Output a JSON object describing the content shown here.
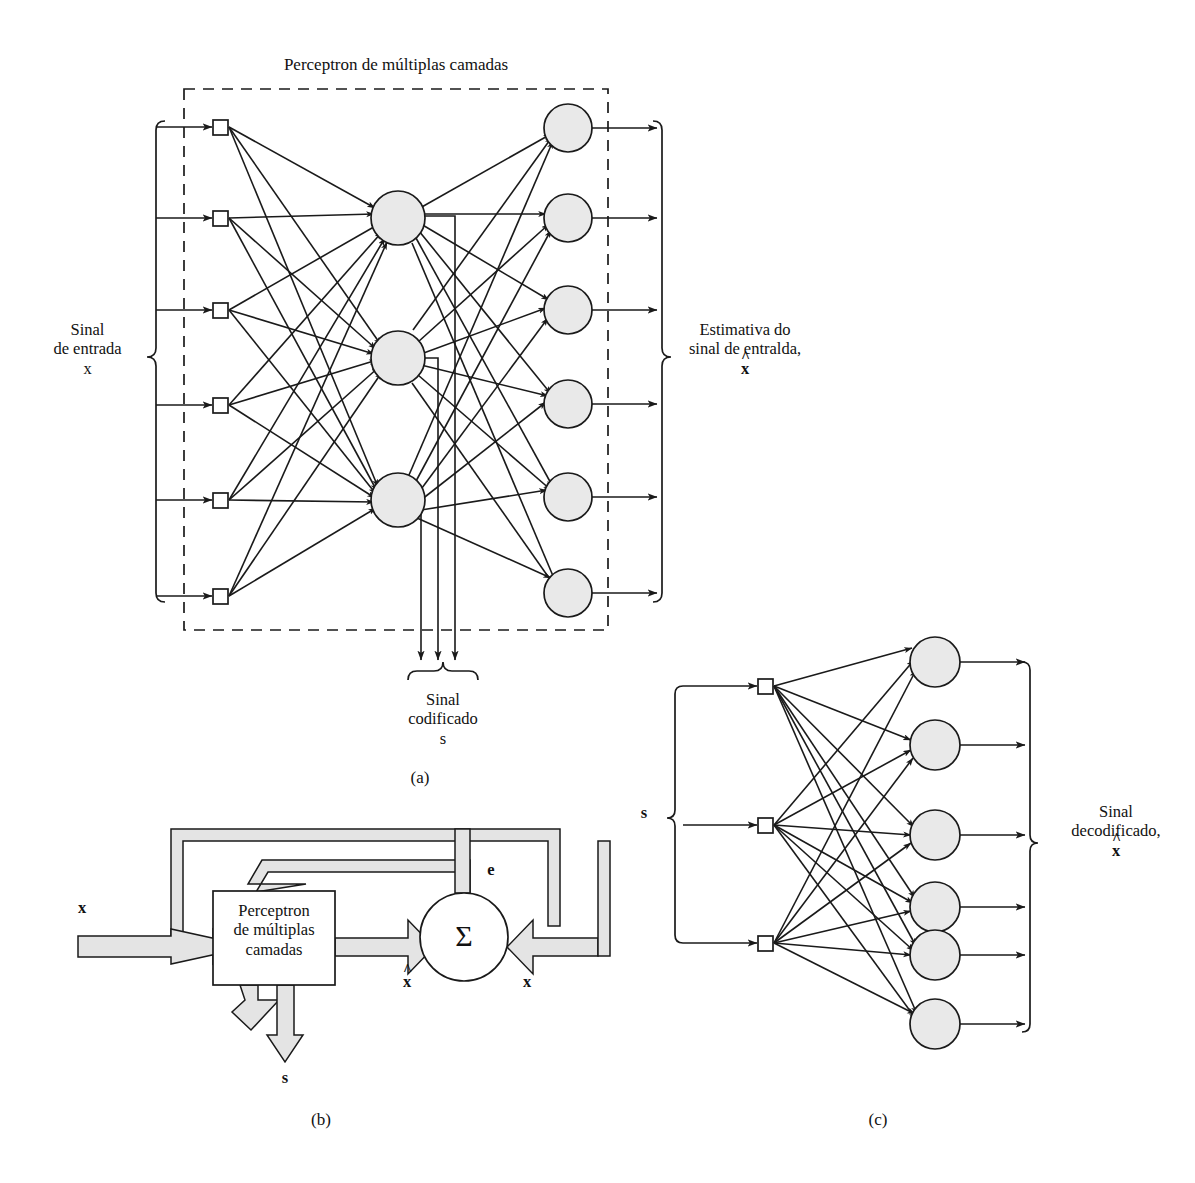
{
  "figure": {
    "type": "diagram",
    "topic": "Multilayer perceptron autoassociative encoder/decoder",
    "language": "pt-BR"
  },
  "panel_a": {
    "caption": "(a)",
    "title": "Perceptron de múltiplas camadas",
    "left_label": {
      "line1": "Sinal",
      "line2": "de entrada",
      "symbol": "x"
    },
    "right_label": {
      "line1": "Estimativa do",
      "line2": "sinal de entralda,",
      "symbol": "x",
      "hat": "^"
    },
    "bottom_label": {
      "line1": "Sinal",
      "line2": "codificado",
      "symbol": "s"
    },
    "network": {
      "input_nodes": 6,
      "hidden_nodes": 3,
      "output_nodes": 6,
      "input_node_shape": "square",
      "hidden_node_shape": "circle",
      "output_node_shape": "circle",
      "encoded_taps": 3,
      "dashed_boundary": true
    }
  },
  "panel_b": {
    "caption": "(b)",
    "block_label": {
      "line1": "Perceptron",
      "line2": "de múltiplas",
      "line3": "camadas"
    },
    "sum_symbol": "Σ",
    "labels": {
      "input": "x",
      "estimate": "x",
      "estimate_hat": "^",
      "error": "e",
      "reference": "x",
      "code_output": "s"
    }
  },
  "panel_c": {
    "caption": "(c)",
    "left_label": "s",
    "right_label": {
      "line1": "Sinal",
      "line2": "decodificado,",
      "symbol": "x",
      "hat": "^"
    },
    "network": {
      "input_nodes": 3,
      "output_nodes": 6,
      "input_node_shape": "square",
      "output_node_shape": "circle"
    }
  },
  "colors": {
    "stroke": "#1a1a1a",
    "node_fill": "#e9e9e9",
    "arrow_fill": "#e0e0e0",
    "background": "#ffffff"
  }
}
